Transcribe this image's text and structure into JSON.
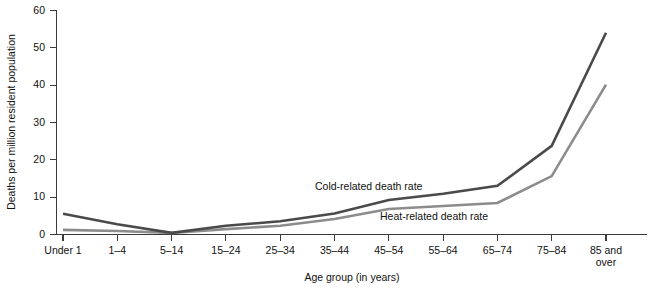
{
  "chart_data": {
    "type": "line",
    "title": "",
    "xlabel": "Age group (in years)",
    "ylabel": "Deaths per million resident population",
    "categories": [
      "Under 1",
      "1–4",
      "5–14",
      "15–24",
      "25–34",
      "35–44",
      "45–54",
      "55–64",
      "65–74",
      "75–84",
      "85 and over"
    ],
    "category_lines": [
      [
        "Under 1"
      ],
      [
        "1–4"
      ],
      [
        "5–14"
      ],
      [
        "15–24"
      ],
      [
        "25–34"
      ],
      [
        "35–44"
      ],
      [
        "45–54"
      ],
      [
        "55–64"
      ],
      [
        "65–74"
      ],
      [
        "75–84"
      ],
      [
        "85 and",
        "over"
      ]
    ],
    "yticks": [
      0,
      10,
      20,
      30,
      40,
      50,
      60
    ],
    "ytick_labels": [
      "0",
      "10",
      "20",
      "30",
      "40",
      "50",
      "60"
    ],
    "ylim": [
      0,
      60
    ],
    "grid": false,
    "legend_position": "inline-annotations",
    "series": [
      {
        "name": "Cold-related death rate",
        "color": "#4a4a4a",
        "values": [
          5.4,
          2.6,
          0.3,
          2.2,
          3.4,
          5.5,
          9.1,
          10.8,
          12.9,
          23.6,
          53.9
        ],
        "annotation": {
          "text": "Cold-related death rate",
          "x": 315,
          "y": 190
        }
      },
      {
        "name": "Heat-related death rate",
        "color": "#8c8c8c",
        "values": [
          1.1,
          0.8,
          0.3,
          1.3,
          2.2,
          4.0,
          6.7,
          7.5,
          8.3,
          15.5,
          40.0
        ],
        "annotation": {
          "text": "Heat-related death rate",
          "x": 380,
          "y": 220
        }
      }
    ]
  },
  "axes": {
    "y_title": "Deaths per million resident population",
    "x_title": "Age group (in years)"
  }
}
